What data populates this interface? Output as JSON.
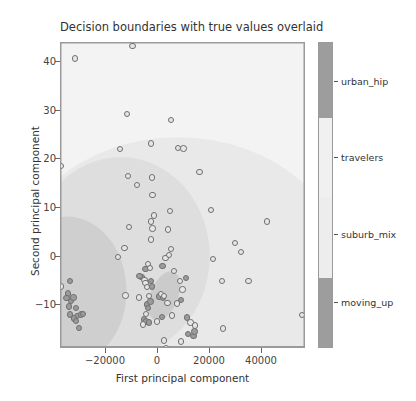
{
  "chart_data": {
    "type": "scatter",
    "title": "Decision boundaries with true values overlaid",
    "xlabel": "First principal component",
    "ylabel": "Second principal component",
    "xlim": [
      -36000,
      57000
    ],
    "ylim": [
      -16.5,
      44.5
    ],
    "xticks": [
      -20000,
      0,
      20000,
      40000
    ],
    "xticklabels": [
      "−20000",
      "0",
      "20000",
      "40000"
    ],
    "yticks": [
      40,
      30,
      20,
      10,
      0,
      -10
    ],
    "yticklabels": [
      "40",
      "30",
      "20",
      "10",
      "0",
      "−10"
    ],
    "grid": false,
    "legend_position": "right-colorbar",
    "colorbar": {
      "ticks": [
        "moving_up",
        "suburb_mix",
        "travelers",
        "urban_hip"
      ],
      "segments": [
        {
          "label": "urban_hip",
          "color": "#9d9d9d"
        },
        {
          "label": "travelers",
          "color": "#f0f0f0"
        },
        {
          "label": "suburb_mix",
          "color": "#ededed"
        },
        {
          "label": "moving_up",
          "color": "#9d9d9d"
        }
      ]
    },
    "series": [
      {
        "name": "moving_up",
        "color": "#9b9b9b",
        "points": [
          [
            -32600,
            -3.0
          ],
          [
            -33400,
            -5.4
          ],
          [
            -33900,
            -6.3
          ],
          [
            -32200,
            -6.9
          ],
          [
            -33000,
            -8.0
          ],
          [
            -32500,
            -9.6
          ],
          [
            -31200,
            -6.2
          ],
          [
            -30400,
            -8.3
          ],
          [
            -29900,
            -9.9
          ],
          [
            -29200,
            -12.3
          ],
          [
            -28400,
            -9.6
          ],
          [
            -27700,
            -9.5
          ],
          [
            -31000,
            -10.4
          ],
          [
            -30200,
            -10.9
          ],
          [
            -3300,
            -7.6
          ],
          [
            -3000,
            -8.3
          ],
          [
            -2100,
            -7.0
          ],
          [
            -4500,
            -10.6
          ],
          [
            -3800,
            -11.0
          ],
          [
            -2600,
            -11.2
          ],
          [
            2300,
            -10.1
          ],
          [
            -5400,
            -2.1
          ],
          [
            -3900,
            -0.5
          ],
          [
            2500,
            0.0
          ],
          [
            -1800,
            -3.0
          ],
          [
            -1500,
            -4.0
          ],
          [
            11800,
            -10.2
          ],
          [
            12300,
            -13.5
          ],
          [
            14300,
            -13.9
          ],
          [
            11500,
            -2.3
          ],
          [
            9500,
            -6.7
          ],
          [
            14700,
            -13.0
          ],
          [
            -6200,
            -2.0
          ],
          [
            1200,
            -6.0
          ],
          [
            2700,
            -6.3
          ]
        ]
      },
      {
        "name": "suburb_mix",
        "color": "#e6e6e6",
        "points": [
          [
            -30800,
            41.4
          ],
          [
            -8800,
            43.9
          ],
          [
            -10900,
            30.3
          ],
          [
            -13700,
            23.4
          ],
          [
            -1800,
            24.5
          ],
          [
            5800,
            29.2
          ],
          [
            8300,
            23.6
          ],
          [
            10500,
            23.5
          ],
          [
            -10500,
            18.0
          ],
          [
            -7200,
            16.2
          ],
          [
            -1500,
            17.7
          ],
          [
            16600,
            18.8
          ],
          [
            -1200,
            14.2
          ],
          [
            5400,
            11.0
          ],
          [
            20900,
            11.2
          ],
          [
            -800,
            10.1
          ],
          [
            -1900,
            8.9
          ],
          [
            -10100,
            7.8
          ],
          [
            -1200,
            7.5
          ],
          [
            4600,
            7.3
          ],
          [
            -11900,
            3.6
          ],
          [
            -1800,
            5.3
          ],
          [
            -14300,
            1.8
          ],
          [
            5700,
            3.4
          ],
          [
            3600,
            1.7
          ],
          [
            5100,
            2.2
          ],
          [
            -3000,
            0.5
          ],
          [
            -2300,
            -0.3
          ],
          [
            6800,
            -0.9
          ],
          [
            -4300,
            -2.8
          ],
          [
            -4000,
            -3.4
          ],
          [
            -3300,
            -4.1
          ],
          [
            1900,
            -5.5
          ],
          [
            3100,
            -5.9
          ],
          [
            -2500,
            -5.9
          ],
          [
            -11500,
            -5.8
          ],
          [
            4400,
            -7.3
          ],
          [
            8000,
            -7.4
          ],
          [
            -3700,
            -9.5
          ],
          [
            -4900,
            -11.6
          ],
          [
            6100,
            -9.8
          ],
          [
            13200,
            -11.2
          ],
          [
            14900,
            -11.8
          ],
          [
            3000,
            -14.8
          ],
          [
            9600,
            -15.0
          ],
          [
            21800,
            1.4
          ],
          [
            25000,
            -2.9
          ],
          [
            30000,
            4.6
          ],
          [
            32300,
            2.8
          ],
          [
            35200,
            -3.0
          ],
          [
            42200,
            8.9
          ],
          [
            25600,
            -12.4
          ],
          [
            3800,
            -16.3
          ],
          [
            55500,
            -9.7
          ],
          [
            -36000,
            20.0
          ],
          [
            -36000,
            -4.0
          ],
          [
            9100,
            -3.0
          ],
          [
            10100,
            -4.6
          ],
          [
            -6300,
            -6.2
          ],
          [
            500,
            -11.0
          ]
        ]
      }
    ]
  }
}
